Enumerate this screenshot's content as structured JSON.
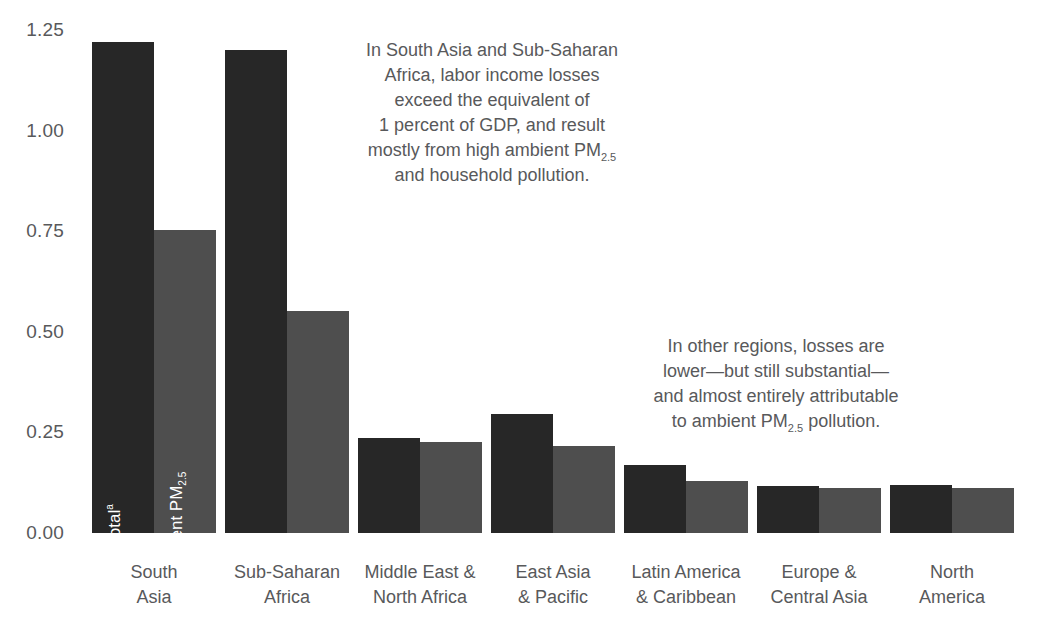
{
  "chart_data": {
    "type": "bar",
    "title": "",
    "xlabel": "",
    "ylabel": "",
    "ylim": [
      0,
      1.25
    ],
    "yticks": [
      "0.00",
      "0.25",
      "0.50",
      "0.75",
      "1.00",
      "1.25"
    ],
    "ytick_values": [
      0,
      0.25,
      0.5,
      0.75,
      1.0,
      1.25
    ],
    "grid": false,
    "legend_position": "in-bar",
    "categories": [
      "South\nAsia",
      "Sub-Saharan\nAfrica",
      "Middle East &\nNorth Africa",
      "East Asia\n& Pacific",
      "Latin America\n& Caribbean",
      "Europe &\nCentral Asia",
      "North\nAmerica"
    ],
    "series": [
      {
        "name": "Total",
        "name_superscript": "a",
        "color": "#272727",
        "values": [
          1.22,
          1.2,
          0.235,
          0.295,
          0.17,
          0.117,
          0.12
        ]
      },
      {
        "name": "Ambient PM",
        "name_subscript": "2.5",
        "color": "#4e4e4e",
        "values": [
          0.752,
          0.552,
          0.227,
          0.215,
          0.13,
          0.113,
          0.112
        ]
      }
    ],
    "annotations": [
      {
        "id": "annotation-high-regions",
        "lines": [
          "In South Asia and Sub-Saharan",
          "Africa, labor income losses",
          "exceed the equivalent of",
          "1 percent of GDP, and result",
          "mostly from high ambient PM<sub>2.5</sub>",
          "and household pollution."
        ]
      },
      {
        "id": "annotation-other-regions",
        "lines": [
          "In other regions, losses are",
          "lower—but still substantial—",
          "and almost entirely attributable",
          "to ambient PM<sub>2.5</sub> pollution."
        ]
      }
    ]
  },
  "axis": {
    "y_ticks": [
      {
        "label": "1.25",
        "value": 1.25
      },
      {
        "label": "1.00",
        "value": 1.0
      },
      {
        "label": "0.75",
        "value": 0.75
      },
      {
        "label": "0.50",
        "value": 0.5
      },
      {
        "label": "0.25",
        "value": 0.25
      },
      {
        "label": "0.00",
        "value": 0.0
      }
    ]
  },
  "x_categories": [
    {
      "line1": "South",
      "line2": "Asia"
    },
    {
      "line1": "Sub-Saharan",
      "line2": "Africa"
    },
    {
      "line1": "Middle East &",
      "line2": "North Africa"
    },
    {
      "line1": "East Asia",
      "line2": "& Pacific"
    },
    {
      "line1": "Latin America",
      "line2": "& Caribbean"
    },
    {
      "line1": "Europe &",
      "line2": "Central Asia"
    },
    {
      "line1": "North",
      "line2": "America"
    }
  ],
  "bar_labels": {
    "total": "Total",
    "total_superscript": "a",
    "ambient": "Ambient PM",
    "ambient_subscript": "2.5"
  },
  "colors": {
    "total_bar": "#272727",
    "ambient_bar": "#4e4e4e",
    "text": "#58595b",
    "background": "#ffffff",
    "bar_label_text": "#ffffff"
  }
}
